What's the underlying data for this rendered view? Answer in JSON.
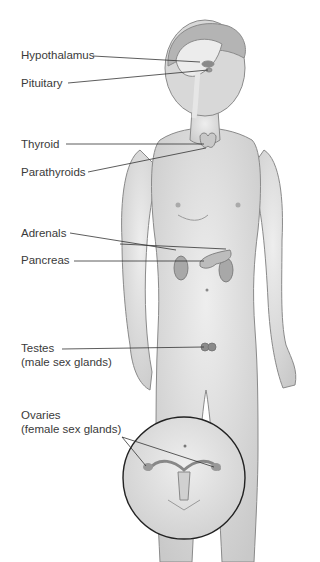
{
  "figure": {
    "labels": [
      {
        "id": "hypothalamus",
        "text": "Hypothalamus"
      },
      {
        "id": "pituitary",
        "text": "Pituitary"
      },
      {
        "id": "thyroid",
        "text": "Thyroid"
      },
      {
        "id": "parathyroids",
        "text": "Parathyroids"
      },
      {
        "id": "adrenals",
        "text": "Adrenals"
      },
      {
        "id": "pancreas",
        "text": "Pancreas"
      },
      {
        "id": "testes",
        "text": "Testes",
        "sub": "(male sex glands)"
      },
      {
        "id": "ovaries",
        "text": "Ovaries",
        "sub": "(female sex glands)"
      }
    ]
  },
  "colors": {
    "skin": "#dcdcdc",
    "outline": "#8a8a8a",
    "organ": "#9a9a9a",
    "line": "#333333",
    "text": "#3a3a3a"
  }
}
